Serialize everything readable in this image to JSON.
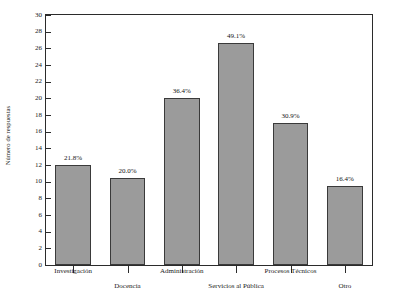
{
  "chart_data": {
    "type": "bar",
    "title": "",
    "subtitle": "",
    "xlabel": "",
    "ylabel": "Número de respuestas",
    "ylim": [
      0,
      30
    ],
    "ytick_step": 2,
    "yticks": [
      30,
      28,
      26,
      24,
      22,
      20,
      18,
      16,
      14,
      12,
      10,
      8,
      6,
      4,
      2,
      0
    ],
    "grid": false,
    "legend": null,
    "categories": [
      "Investigación",
      "Docencia",
      "Administración",
      "Servicios al Pública",
      "Procesos Técnicos",
      "Otro"
    ],
    "values": [
      12,
      10.5,
      20,
      26.6,
      17,
      9.5
    ],
    "data_labels": [
      "21.8%",
      "20.0%",
      "36.4%",
      "49.1%",
      "30.9%",
      "16.4%"
    ],
    "bar_color": "#9b9b9b",
    "bar_border_color": "#3a3a3a",
    "axis_color": "#2b2b2b",
    "background_color": "#ffffff",
    "label_rows": [
      "top",
      "bottom",
      "top",
      "bottom",
      "top",
      "bottom"
    ]
  }
}
